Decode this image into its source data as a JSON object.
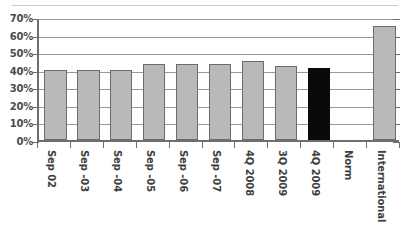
{
  "chart_data": {
    "type": "bar",
    "title": "",
    "subtitle": "",
    "xlabel": "",
    "ylabel": "",
    "ylim": [
      0,
      70
    ],
    "ytick_values": [
      0,
      10,
      20,
      30,
      40,
      50,
      60,
      70
    ],
    "ytick_labels": [
      "0%",
      "10%",
      "20%",
      "30%",
      "40%",
      "50%",
      "60%",
      "70%"
    ],
    "grid": true,
    "legend": "none",
    "categories": [
      "Sep 02",
      "Sep -03",
      "Sep -04",
      "Sep -05",
      "Sep -06",
      "Sep -07",
      "4Q 2008",
      "3Q 2009",
      "4Q 2009",
      "Norm",
      "International"
    ],
    "values": [
      40,
      40,
      40,
      43,
      43,
      43,
      45,
      42,
      41,
      null,
      65
    ],
    "bar_styles": [
      "normal",
      "normal",
      "normal",
      "normal",
      "normal",
      "normal",
      "normal",
      "normal",
      "highlight",
      "none",
      "normal"
    ],
    "colors": {
      "bar_fill": "#b9b9b9",
      "bar_border": "#6b6b6b",
      "highlight_fill": "#0a0a0a",
      "gridline": "#9a9a9a",
      "axis": "#6e6e6e",
      "text": "#3f3f3f",
      "background": "#ffffff"
    }
  }
}
